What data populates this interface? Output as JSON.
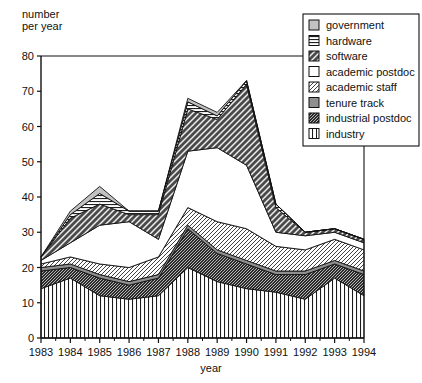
{
  "chart_data": {
    "type": "area",
    "stacked": true,
    "title": "",
    "xlabel": "year",
    "ylabel": "number\nper year",
    "x": [
      1983,
      1984,
      1985,
      1986,
      1987,
      1988,
      1989,
      1990,
      1991,
      1992,
      1993,
      1994
    ],
    "xticklabels": [
      "1983",
      "1984",
      "1985",
      "1986",
      "1987",
      "1988",
      "1989",
      "1990",
      "1991",
      "1992",
      "1993",
      "1994"
    ],
    "yticklabels": [
      "0",
      "10",
      "20",
      "30",
      "40",
      "50",
      "60",
      "70",
      "80"
    ],
    "ylim": [
      0,
      80
    ],
    "xlim": [
      1983,
      1994
    ],
    "ytick_step": 10,
    "grid": false,
    "legend_position": "top-right",
    "stack_order_bottom_to_top": [
      "industry",
      "industrial postdoc",
      "tenure track",
      "academic staff",
      "academic postdoc",
      "software",
      "hardware",
      "government"
    ],
    "series": [
      {
        "name": "industry",
        "pattern": "vertical-lines",
        "color": "#ffffff",
        "values": [
          14,
          17,
          12,
          11,
          12,
          20,
          16,
          14,
          13,
          11,
          17,
          12
        ]
      },
      {
        "name": "industrial postdoc",
        "pattern": "dense-diagonal-dark",
        "color": "#3a3a3a",
        "values": [
          5,
          3,
          5,
          4,
          5,
          11,
          8,
          7,
          5,
          7,
          4,
          6
        ]
      },
      {
        "name": "tenure track",
        "pattern": "solid-gray",
        "color": "#8c8c8c",
        "values": [
          1,
          1,
          1,
          1,
          1,
          1,
          1,
          1,
          1,
          1,
          1,
          1
        ]
      },
      {
        "name": "academic staff",
        "pattern": "light-diagonal",
        "color": "#d8d8d8",
        "values": [
          1,
          2,
          3,
          4,
          5,
          5,
          8,
          9,
          7,
          6,
          6,
          6
        ]
      },
      {
        "name": "academic postdoc",
        "pattern": "blank-white",
        "color": "#ffffff",
        "values": [
          1,
          4,
          11,
          13,
          5,
          16,
          21,
          18,
          4,
          4,
          2,
          2
        ]
      },
      {
        "name": "software",
        "pattern": "wide-diagonal-dark",
        "color": "#595959",
        "values": [
          1,
          7,
          6,
          2,
          7,
          12,
          8,
          23,
          7,
          1,
          1,
          1
        ]
      },
      {
        "name": "hardware",
        "pattern": "horizontal-lines",
        "color": "#6e6e6e",
        "values": [
          0,
          1,
          3,
          1,
          1,
          2,
          1,
          1,
          1,
          0,
          0,
          0
        ]
      },
      {
        "name": "government",
        "pattern": "light-gray-solid",
        "color": "#bdbdbd",
        "values": [
          0,
          1,
          2,
          0,
          0,
          1,
          1,
          0,
          0,
          0,
          0,
          0
        ]
      }
    ],
    "legend_entries": [
      {
        "label": "government",
        "pattern": "light-gray-solid"
      },
      {
        "label": "hardware",
        "pattern": "horizontal-lines"
      },
      {
        "label": "software",
        "pattern": "wide-diagonal-dark"
      },
      {
        "label": "academic postdoc",
        "pattern": "blank-white"
      },
      {
        "label": "academic staff",
        "pattern": "light-diagonal"
      },
      {
        "label": "tenure track",
        "pattern": "solid-gray"
      },
      {
        "label": "industrial postdoc",
        "pattern": "dense-diagonal-dark"
      },
      {
        "label": "industry",
        "pattern": "vertical-lines"
      }
    ]
  }
}
